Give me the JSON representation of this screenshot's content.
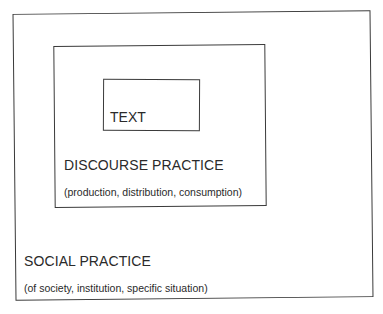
{
  "diagram": {
    "type": "nested-boxes",
    "layers": [
      {
        "id": "social-practice",
        "title": "SOCIAL PRACTICE",
        "subtitle": "(of society, institution, specific situation)"
      },
      {
        "id": "discourse-practice",
        "title": "DISCOURSE PRACTICE",
        "subtitle": "(production, distribution, consumption)"
      },
      {
        "id": "text",
        "title": "TEXT"
      }
    ],
    "colors": {
      "line": "#3a3a3a",
      "text": "#2a2a2a",
      "background": "#ffffff"
    }
  }
}
